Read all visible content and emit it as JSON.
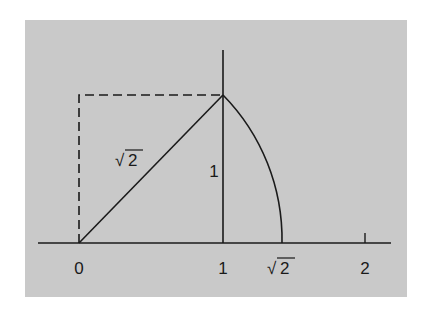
{
  "diagram": {
    "axis_labels": {
      "zero": "0",
      "one": "1",
      "sqrt2": "2",
      "two": "2"
    },
    "segment_labels": {
      "diagonal": "2",
      "vertical_side": "1"
    },
    "radical_symbol": "√",
    "colors": {
      "panel": "#c9c9c9",
      "ink": "#1a1a1a",
      "background": "#ffffff"
    }
  }
}
